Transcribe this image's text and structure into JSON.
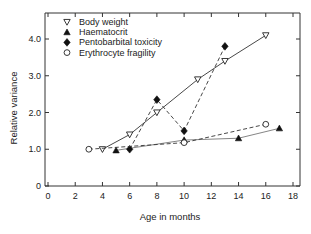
{
  "chart_data": {
    "type": "line",
    "title": "",
    "xlabel": "Age in months",
    "ylabel": "Relative variance",
    "xlim": [
      0,
      18
    ],
    "ylim": [
      0,
      4.5
    ],
    "xticks": [
      0,
      2,
      4,
      6,
      8,
      10,
      12,
      14,
      16,
      18
    ],
    "xtick_labels": [
      "0",
      "2",
      "4",
      "6",
      "8",
      "10",
      "12",
      "14",
      "16",
      "18"
    ],
    "yticks": [
      0,
      1.0,
      2.0,
      3.0,
      4.0
    ],
    "ytick_labels": [
      "0",
      "1.0",
      "2.0",
      "3.0",
      "4.0"
    ],
    "grid": false,
    "legend_position": "upper left",
    "series": [
      {
        "name": "Body weight",
        "marker": "open-triangle-down",
        "line": "solid",
        "color": "#222222",
        "x": [
          4,
          6,
          8,
          11,
          13,
          16
        ],
        "values": [
          1.0,
          1.4,
          2.0,
          2.9,
          3.4,
          4.1
        ]
      },
      {
        "name": "Haematocrit",
        "marker": "filled-triangle-up",
        "line": "thin-solid",
        "color": "#222222",
        "x": [
          5,
          10,
          14,
          17
        ],
        "values": [
          0.97,
          1.25,
          1.3,
          1.57
        ]
      },
      {
        "name": "Pentobarbital toxicity",
        "marker": "filled-diamond",
        "line": "dashed",
        "color": "#222222",
        "x": [
          6,
          8,
          10,
          13
        ],
        "values": [
          1.0,
          2.35,
          1.5,
          3.8
        ]
      },
      {
        "name": "Erythrocyte fragility",
        "marker": "open-circle",
        "line": "dashed",
        "color": "#222222",
        "x": [
          3,
          10,
          16
        ],
        "values": [
          1.0,
          1.18,
          1.68
        ]
      }
    ]
  },
  "legend": {
    "items": [
      {
        "label": "Body weight",
        "icon": "open-triangle-down-icon"
      },
      {
        "label": "Haematocrit",
        "icon": "filled-triangle-icon"
      },
      {
        "label": "Pentobarbital toxicity",
        "icon": "filled-diamond-icon"
      },
      {
        "label": "Erythrocyte fragility",
        "icon": "open-circle-icon"
      }
    ]
  }
}
